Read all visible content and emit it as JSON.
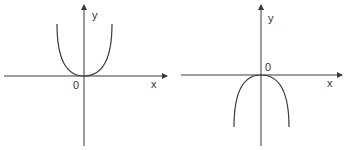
{
  "graphs": [
    {
      "id": "left",
      "description": "Upward-opening parabola with vertex at origin",
      "labels": {
        "y_axis": "y",
        "x_axis": "x",
        "origin": "0"
      },
      "curve": "y = a*x^2, a > 0"
    },
    {
      "id": "right",
      "description": "Downward-opening parabola with vertex at origin",
      "labels": {
        "y_axis": "y",
        "x_axis": "x",
        "origin": "0"
      },
      "curve": "y = a*x^2, a < 0"
    }
  ],
  "colors": {
    "stroke": "#3a3a3a",
    "text": "#333333",
    "background": "#ffffff"
  }
}
